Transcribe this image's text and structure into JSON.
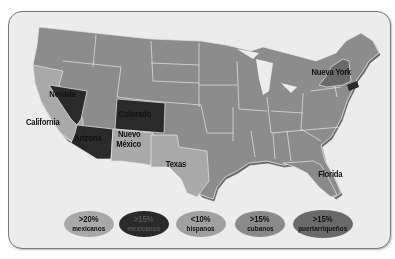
{
  "map": {
    "colors": {
      "background": "#ececec",
      "base_state": "#8c8c8c",
      "mexicanos_20": "#a9a9a9",
      "mexicanos_15": "#2a2a2a",
      "hispanos_10": "#a0a0a0",
      "cubanos_15": "#8a8a8a",
      "puertorriquenos_15": "#6a6a6a",
      "border": "#e8e8e8"
    },
    "state_labels": {
      "nevada": "Nevada",
      "colorado": "Colorado",
      "california": "California",
      "arizona": "Arizona",
      "nuevo_mexico_1": "Nuevo",
      "nuevo_mexico_2": "México",
      "texas": "Texas",
      "florida": "Florida",
      "nueva_york": "Nueva York"
    }
  },
  "legend": [
    {
      "pct": ">20%",
      "group": "mexicanos",
      "color": "#a9a9a9"
    },
    {
      "pct": ">15%",
      "group": "mexicanos",
      "color": "#2a2a2a"
    },
    {
      "pct": "<10%",
      "group": "hispanos",
      "color": "#a0a0a0"
    },
    {
      "pct": ">15%",
      "group": "cubanos",
      "color": "#8a8a8a"
    },
    {
      "pct": ">15%",
      "group": "puertarriqueños",
      "color": "#6a6a6a"
    }
  ]
}
